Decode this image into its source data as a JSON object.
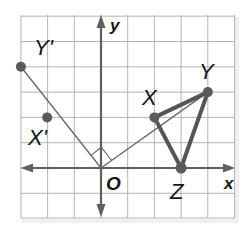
{
  "diagram": {
    "type": "coordinate-plane-rotation",
    "grid": {
      "x_min": -3,
      "x_max": 5,
      "y_min": -2,
      "y_max": 6,
      "origin_px": [
        101,
        168
      ],
      "unit_px_x": 26.7,
      "unit_px_y": 25.3,
      "line_color": "#b3b3b3"
    },
    "axes": {
      "x_label": "x",
      "y_label": "y",
      "origin_label": "O",
      "color": "#5e5e5e"
    },
    "points": [
      {
        "name": "X",
        "label": "X",
        "coords": [
          2,
          2
        ]
      },
      {
        "name": "Y",
        "label": "Y",
        "coords": [
          4,
          3
        ]
      },
      {
        "name": "Z",
        "label": "Z",
        "coords": [
          3,
          0
        ]
      },
      {
        "name": "X'",
        "label": "X'",
        "coords": [
          -2,
          2
        ]
      },
      {
        "name": "Y'",
        "label": "Y'",
        "coords": [
          -3,
          4
        ]
      }
    ],
    "triangle": {
      "vertices": [
        "X",
        "Y",
        "Z"
      ],
      "color": "#555555"
    },
    "rays": [
      {
        "from": "O",
        "to": "Y"
      },
      {
        "from": "O",
        "to": "Y'"
      }
    ],
    "right_angle_marker": {
      "at": "O",
      "between": [
        "Y",
        "Y'"
      ]
    },
    "transformation": "rotation 90° counterclockwise about origin O"
  }
}
